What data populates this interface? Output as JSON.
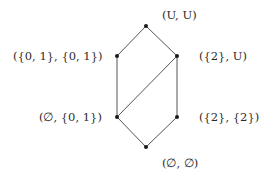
{
  "diagram": {
    "type": "hasse-diagram",
    "colors": {
      "edge": "#555555",
      "node": "#1a1a1a",
      "text": "#2a2a2a",
      "background": "#ffffff"
    },
    "nodes": [
      {
        "id": "top",
        "label": "(U, U)",
        "x": 146,
        "y": 26
      },
      {
        "id": "left-upper",
        "label": "({0,1}, {0,1})",
        "x": 117,
        "y": 56
      },
      {
        "id": "right-upper",
        "label": "({2}, U)",
        "x": 177,
        "y": 56
      },
      {
        "id": "left-lower",
        "label": "(∅, {0,1})",
        "x": 117,
        "y": 117
      },
      {
        "id": "right-lower",
        "label": "({2}, {2})",
        "x": 177,
        "y": 117
      },
      {
        "id": "bottom",
        "label": "(∅, ∅)",
        "x": 146,
        "y": 147
      }
    ],
    "edges": [
      [
        "top",
        "left-upper"
      ],
      [
        "top",
        "right-upper"
      ],
      [
        "left-upper",
        "left-lower"
      ],
      [
        "right-upper",
        "right-lower"
      ],
      [
        "right-upper",
        "left-lower"
      ],
      [
        "left-lower",
        "bottom"
      ],
      [
        "right-lower",
        "bottom"
      ]
    ],
    "labels": {
      "top": "(U, U)",
      "left_upper": "({0, 1}, {0, 1})",
      "right_upper": "({2}, U)",
      "left_lower": "(∅, {0, 1})",
      "right_lower": "({2}, {2})",
      "bottom": "(∅, ∅)"
    }
  }
}
